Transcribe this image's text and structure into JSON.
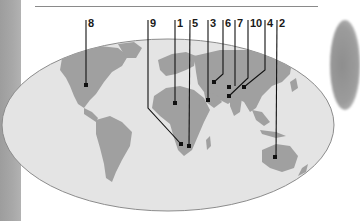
{
  "figure": {
    "type": "world-map-locator",
    "colors": {
      "ocean": "#e4e4e4",
      "land": "#a0a0a0",
      "outline": "#8c8c8c",
      "leader": "#111111",
      "side_strip": "#a4a4a4",
      "background": "#ffffff"
    },
    "labels": [
      {
        "id": "8",
        "text": "8",
        "x": 86,
        "dot": [
          86,
          85
        ]
      },
      {
        "id": "9",
        "text": "9",
        "x": 148,
        "dot": [
          181,
          144
        ]
      },
      {
        "id": "1",
        "text": "1",
        "x": 175,
        "dot": [
          175,
          103
        ]
      },
      {
        "id": "5",
        "text": "5",
        "x": 190,
        "dot": [
          189,
          146
        ]
      },
      {
        "id": "3",
        "text": "3",
        "x": 208,
        "dot": [
          208,
          100
        ]
      },
      {
        "id": "6",
        "text": "6",
        "x": 223,
        "dot": [
          214,
          82
        ]
      },
      {
        "id": "7",
        "text": "7",
        "x": 235,
        "dot": [
          229,
          87
        ]
      },
      {
        "id": "10",
        "text": "10",
        "x": 248,
        "dot": [
          229,
          96
        ]
      },
      {
        "id": "4",
        "text": "4",
        "x": 265,
        "dot": [
          244,
          87
        ]
      },
      {
        "id": "2",
        "text": "2",
        "x": 277,
        "dot": [
          275,
          157
        ]
      }
    ]
  }
}
